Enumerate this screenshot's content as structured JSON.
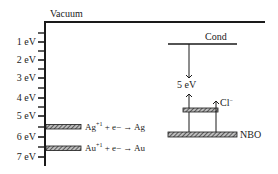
{
  "diagram": {
    "vacuum_label": "Vacuum",
    "axis": {
      "unit": "eV",
      "ticks": [
        {
          "value": 1,
          "label": "1 eV",
          "y": 42
        },
        {
          "value": 2,
          "label": "2 eV",
          "y": 60
        },
        {
          "value": 3,
          "label": "3 eV",
          "y": 78
        },
        {
          "value": 4,
          "label": "4 eV",
          "y": 98
        },
        {
          "value": 5,
          "label": "5 eV",
          "y": 116
        },
        {
          "value": 6,
          "label": "6 eV",
          "y": 137
        },
        {
          "value": 7,
          "label": "7 eV",
          "y": 157
        }
      ]
    },
    "levels": {
      "ag": {
        "ion": "Ag",
        "charge": "+1",
        "rest": " + e− → Ag"
      },
      "au": {
        "ion": "Au",
        "charge": "+1",
        "rest": " + e− → Au"
      },
      "cond_label": "Cond",
      "gap_label": "5 eV",
      "cl_label": "Cl",
      "cl_charge": "−",
      "nbo_label": "NBO"
    },
    "colors": {
      "line": "#1a1a1a",
      "hatch_dark": "#333333",
      "hatch_light": "#bbbbbb"
    }
  }
}
